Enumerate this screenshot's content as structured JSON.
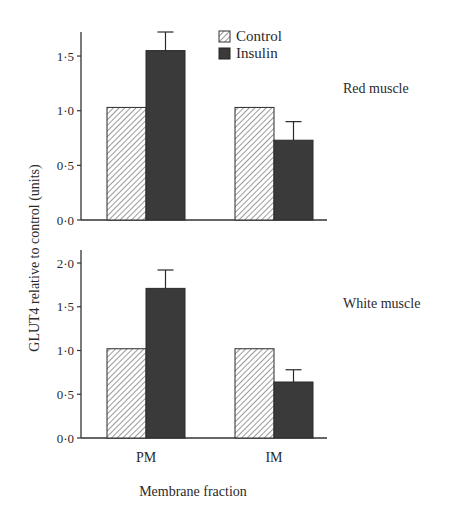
{
  "chart_data": [
    {
      "type": "bar",
      "title": "Red muscle",
      "categories": [
        "PM",
        "IM"
      ],
      "series": [
        {
          "name": "Control",
          "values": [
            1.03,
            1.03
          ],
          "errors": [
            null,
            null
          ],
          "pattern": "hatched"
        },
        {
          "name": "Insulin",
          "values": [
            1.55,
            0.73
          ],
          "errors": [
            0.17,
            0.17
          ],
          "pattern": "solid"
        }
      ],
      "ylim": [
        0,
        1.7
      ],
      "yticks": [
        "0·0",
        "0·5",
        "1·0",
        "1·5"
      ],
      "ytick_values": [
        0,
        0.5,
        1.0,
        1.5
      ],
      "grid": false
    },
    {
      "type": "bar",
      "title": "White muscle",
      "categories": [
        "PM",
        "IM"
      ],
      "series": [
        {
          "name": "Control",
          "values": [
            1.02,
            1.02
          ],
          "errors": [
            null,
            null
          ],
          "pattern": "hatched"
        },
        {
          "name": "Insulin",
          "values": [
            1.71,
            0.64
          ],
          "errors": [
            0.21,
            0.14
          ],
          "pattern": "solid"
        }
      ],
      "ylim": [
        0,
        2.15
      ],
      "yticks": [
        "0·0",
        "0·5",
        "1·0",
        "1·5",
        "2·0"
      ],
      "ytick_values": [
        0,
        0.5,
        1.0,
        1.5,
        2.0
      ],
      "grid": false
    }
  ],
  "shared": {
    "ylabel": "GLUT4 relative to control (units)",
    "xlabel": "Membrane fraction",
    "x_categories": [
      "PM",
      "IM"
    ],
    "legend": [
      {
        "label": "Control",
        "pattern": "hatched"
      },
      {
        "label": "Insulin",
        "pattern": "solid"
      }
    ],
    "legend_position": "top-center"
  },
  "colors": {
    "insulin_fill": "#3a3a3a",
    "control_fill": "#ffffff",
    "hatch": "#555555",
    "axis": "#333333"
  }
}
